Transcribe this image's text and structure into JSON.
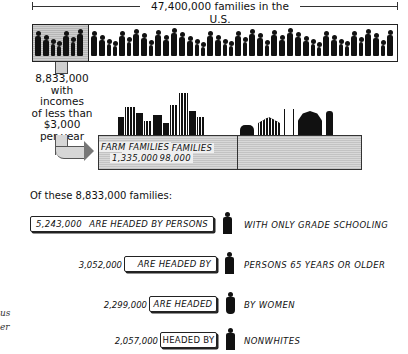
{
  "header": {
    "total_label": "47,400,000 families in the U.S."
  },
  "low_income": {
    "count": "8,833,000",
    "line1": "with incomes",
    "line2": "of less than",
    "line3": "$3,000",
    "line4": "per year"
  },
  "breakdown": {
    "nonfarm": {
      "label": "NONFARM FAMILIES",
      "value": "7,498,000"
    },
    "farm": {
      "label": "FARM FAMILIES",
      "value": "1,335,000"
    }
  },
  "subtitle": "Of these 8,833,000 families:",
  "rows": [
    {
      "value": "5,243,000",
      "box_text": "ARE HEADED BY PERSONS",
      "tail": "WITH ONLY GRADE SCHOOLING",
      "icon": "schoolboy-icon"
    },
    {
      "value": "3,052,000",
      "box_text": "ARE HEADED BY",
      "tail": "PERSONS 65 YEARS OR OLDER",
      "icon": "elderly-person-icon"
    },
    {
      "value": "2,299,000",
      "box_text": "ARE HEADED",
      "tail": "BY WOMEN",
      "icon": "woman-icon"
    },
    {
      "value": "2,057,000",
      "box_text": "HEADED BY",
      "tail": "NONWHITES",
      "icon": "man-icon"
    }
  ],
  "margin_fragments": [
    "us",
    "er"
  ],
  "chart_data": {
    "type": "bar",
    "title": "47,400,000 families in the U.S.",
    "total_families": 47400000,
    "low_income_families": 8833000,
    "low_income_threshold": "$3,000 per year",
    "categories": [
      "Nonfarm families",
      "Farm families"
    ],
    "values": [
      7498000,
      1335000
    ],
    "characteristics": {
      "categories": [
        "Headed by persons with only grade schooling",
        "Headed by persons 65 years or older",
        "Headed by women",
        "Headed by nonwhites"
      ],
      "values": [
        5243000,
        3052000,
        2299000,
        2057000
      ]
    }
  }
}
